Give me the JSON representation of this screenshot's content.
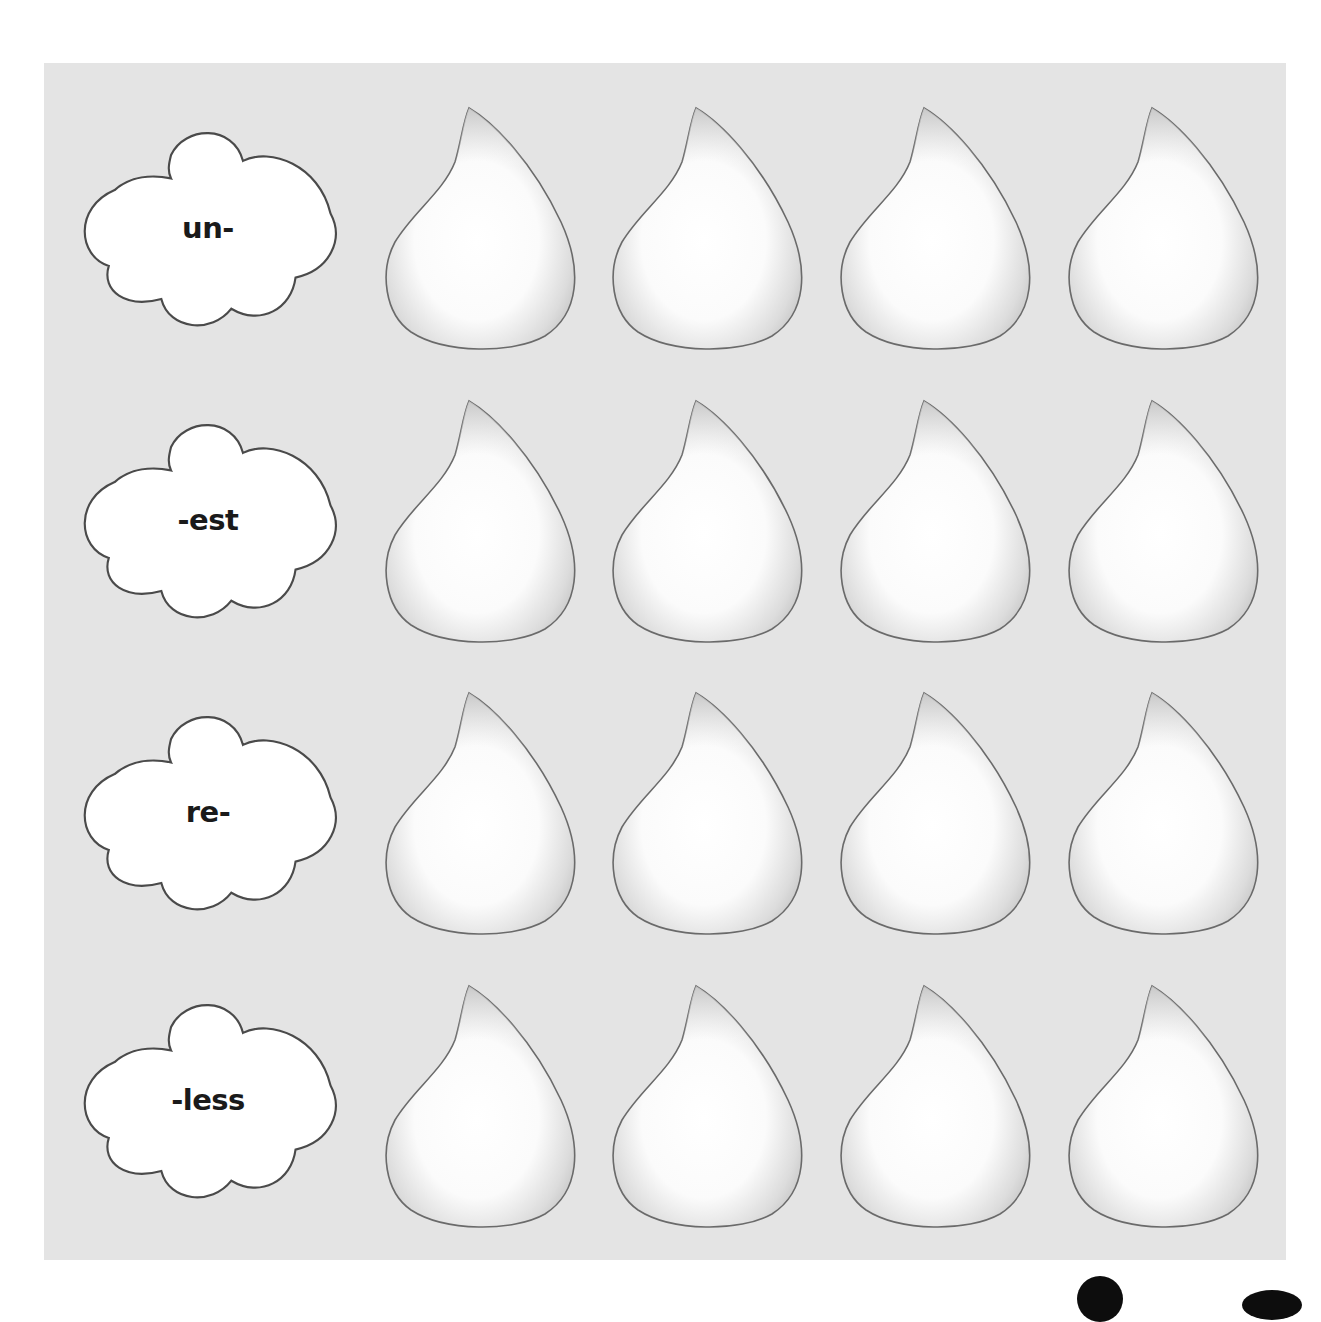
{
  "worksheet": {
    "background_color": "#e4e4e4",
    "rows": [
      {
        "affix": "un-",
        "blanks": 4
      },
      {
        "affix": "-est",
        "blanks": 4
      },
      {
        "affix": "re-",
        "blanks": 4
      },
      {
        "affix": "-less",
        "blanks": 4
      }
    ]
  },
  "icons": {
    "cloud": "cloud-shape",
    "drop": "raindrop-shape"
  }
}
